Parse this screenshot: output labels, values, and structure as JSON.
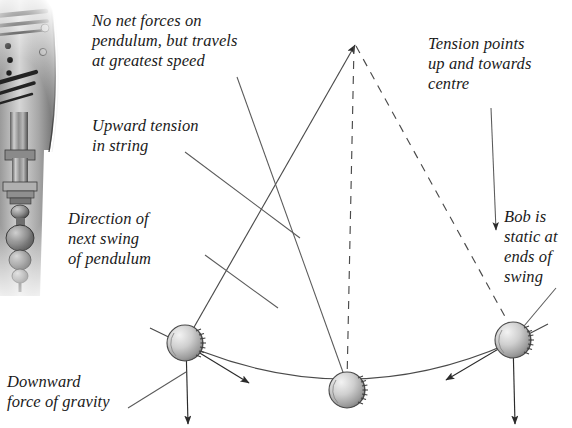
{
  "figure": {
    "type": "physics-diagram",
    "background_color": "#ffffff",
    "ink_color": "#2b2b2b"
  },
  "photo": {
    "name": "pendulum-clock-photo",
    "description": "grayscale photograph of clock pendulum mechanism"
  },
  "labels": {
    "no_net_forces": "No net forces on\npendulum, but travels\nat greatest speed",
    "upward_tension": "Upward tension\nin string",
    "direction_of_swing": "Direction of\nnext swing\nof pendulum",
    "downward_gravity": "Downward\nforce of gravity",
    "tension_points": "Tension points\nup and towards\ncentre",
    "bob_static": "Bob is\nstatic at\nends of\nswing"
  },
  "diagram": {
    "pivot": {
      "x": 354,
      "y": 42
    },
    "bobs": [
      {
        "name": "bob-left",
        "x": 185,
        "y": 343,
        "r": 18
      },
      {
        "name": "bob-centre",
        "x": 347,
        "y": 390,
        "r": 18
      },
      {
        "name": "bob-right",
        "x": 513,
        "y": 340,
        "r": 18
      }
    ],
    "strings": [
      {
        "name": "string-left",
        "style": "solid",
        "from": [
          354,
          42
        ],
        "to": [
          185,
          343
        ]
      },
      {
        "name": "string-centre",
        "style": "dashed",
        "from": [
          354,
          42
        ],
        "to": [
          347,
          390
        ]
      },
      {
        "name": "string-right",
        "style": "dashed",
        "from": [
          354,
          42
        ],
        "to": [
          513,
          340
        ]
      }
    ],
    "arc": {
      "name": "swing-arc",
      "from": [
        168,
        333
      ],
      "through": [
        347,
        402
      ],
      "to": [
        530,
        330
      ]
    },
    "force_vectors": [
      {
        "name": "gravity-arrow-left",
        "from": [
          185,
          343
        ],
        "to": [
          187,
          425
        ],
        "label": "weight"
      },
      {
        "name": "gravity-arrow-right",
        "from": [
          513,
          340
        ],
        "to": [
          515,
          425
        ],
        "label": "weight"
      },
      {
        "name": "tension-arrow-left",
        "from": [
          185,
          343
        ],
        "to": [
          354,
          44
        ],
        "label": "tension"
      },
      {
        "name": "swing-arrow-left",
        "from": [
          185,
          343
        ],
        "to": [
          247,
          382
        ],
        "label": "direction of motion"
      },
      {
        "name": "swing-arrow-right",
        "from": [
          513,
          340
        ],
        "to": [
          447,
          379
        ],
        "label": "direction of motion"
      }
    ]
  }
}
